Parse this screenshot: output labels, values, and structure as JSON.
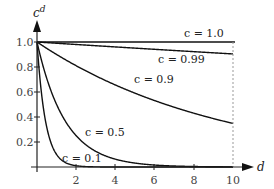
{
  "chart_data": {
    "type": "line",
    "title": "",
    "xlabel": "d",
    "ylabel": "c^d",
    "xlim": [
      0,
      10
    ],
    "ylim": [
      0,
      1.0
    ],
    "x_ticks": [
      2,
      4,
      6,
      8,
      10
    ],
    "y_ticks": [
      0.2,
      0.4,
      0.6,
      0.8,
      1.0
    ],
    "x_tick_labels": [
      "2",
      "4",
      "6",
      "8",
      "10"
    ],
    "y_tick_labels": [
      "0.2",
      "0.4",
      "0.6",
      "0.8",
      "1.0"
    ],
    "grid": false,
    "legend": "inline labels",
    "annotations": [
      "dashed vertical line at d = 10"
    ],
    "series": [
      {
        "name": "c = 1.0",
        "c": 1.0,
        "label": "c = 1.0"
      },
      {
        "name": "c = 0.99",
        "c": 0.99,
        "label": "c = 0.99"
      },
      {
        "name": "c = 0.9",
        "c": 0.9,
        "label": "c = 0.9"
      },
      {
        "name": "c = 0.5",
        "c": 0.5,
        "label": "c = 0.5"
      },
      {
        "name": "c = 0.1",
        "c": 0.1,
        "label": "c = 0.1"
      }
    ],
    "function": "y = c^d"
  },
  "labels": {
    "y_axis_base": "c",
    "y_axis_exp": "d",
    "x_axis": "d",
    "c10": "c = 1.0",
    "c099": "c = 0.99",
    "c09": "c = 0.9",
    "c05": "c = 0.5",
    "c01": "c = 0.1",
    "y10": "1.0",
    "y08": "0.8",
    "y06": "0.6",
    "y04": "0.4",
    "y02": "0.2",
    "x2": "2",
    "x4": "4",
    "x6": "6",
    "x8": "8",
    "x10": "10"
  }
}
